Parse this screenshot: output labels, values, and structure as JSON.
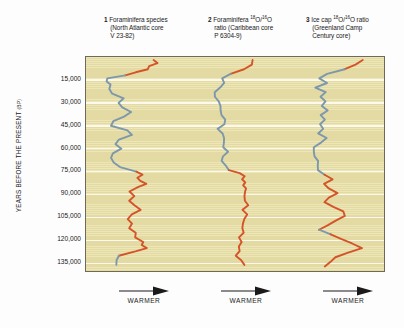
{
  "figure": {
    "background_color": "#fdfdfd",
    "plot_background_color": "#e9e1ab",
    "gridline_color": "#fdfbf0",
    "frame_color": "#6f6a58",
    "cold_color": "#7d98ab",
    "warm_color": "#d4542a",
    "y_axis_label_main": "YEARS BEFORE THE PRESENT",
    "y_axis_label_unit": "(BP)",
    "columns": [
      {
        "number": "1",
        "title": "Foraminifera species",
        "line2": "(North Atlantic core",
        "line3": "V 23-82)",
        "warmer_label": "WARMER"
      },
      {
        "number": "2",
        "title_pre": "Foraminifera ",
        "iso_sup1": "18",
        "iso_mid": "O/",
        "iso_sup2": "16",
        "iso_post": "O",
        "line2": "ratio (Caribbean core",
        "line3": "P 6304-9)",
        "warmer_label": "WARMER"
      },
      {
        "number": "3",
        "title_pre": "Ice cap ",
        "iso_sup1": "18",
        "iso_mid": "O/",
        "iso_sup2": "16",
        "iso_post": "O ratio",
        "line2": "(Greenland Camp",
        "line3": "Century core)",
        "warmer_label": "WARMER"
      }
    ]
  },
  "chart_data": {
    "type": "line",
    "title": "",
    "orientation": "vertical-depth",
    "xlabel": "WARMER",
    "ylabel": "YEARS BEFORE THE PRESENT (BP)",
    "ylim": [
      0,
      140000
    ],
    "y_inverted": true,
    "grid": true,
    "legend": "none",
    "ytick_labels": [
      "15,000",
      "30,000",
      "45,000",
      "60,000",
      "75,000",
      "90,000",
      "105,000",
      "120,000",
      "135,000"
    ],
    "ytick_values": [
      15000,
      30000,
      45000,
      60000,
      75000,
      90000,
      105000,
      120000,
      135000
    ],
    "series": [
      {
        "name": "Foraminifera species (North Atlantic core V 23-82)",
        "panel": 1,
        "x_axis_meaning": "relative warmth (right = warmer)",
        "cold_color": "#7d98ab",
        "warm_color": "#d4542a",
        "points": [
          {
            "age": 2000,
            "x": 0.74,
            "mode": "warm"
          },
          {
            "age": 4000,
            "x": 0.78,
            "mode": "warm"
          },
          {
            "age": 6000,
            "x": 0.7,
            "mode": "warm"
          },
          {
            "age": 8000,
            "x": 0.66,
            "mode": "warm"
          },
          {
            "age": 10000,
            "x": 0.56,
            "mode": "warm"
          },
          {
            "age": 12000,
            "x": 0.4,
            "mode": "cold"
          },
          {
            "age": 14000,
            "x": 0.24,
            "mode": "cold"
          },
          {
            "age": 16000,
            "x": 0.2,
            "mode": "cold"
          },
          {
            "age": 18000,
            "x": 0.26,
            "mode": "cold"
          },
          {
            "age": 21000,
            "x": 0.22,
            "mode": "cold"
          },
          {
            "age": 24000,
            "x": 0.3,
            "mode": "cold"
          },
          {
            "age": 27000,
            "x": 0.4,
            "mode": "cold"
          },
          {
            "age": 30000,
            "x": 0.33,
            "mode": "cold"
          },
          {
            "age": 33000,
            "x": 0.41,
            "mode": "cold"
          },
          {
            "age": 36000,
            "x": 0.48,
            "mode": "cold"
          },
          {
            "age": 39000,
            "x": 0.4,
            "mode": "cold"
          },
          {
            "age": 42000,
            "x": 0.3,
            "mode": "cold"
          },
          {
            "age": 45000,
            "x": 0.26,
            "mode": "cold"
          },
          {
            "age": 48000,
            "x": 0.44,
            "mode": "cold"
          },
          {
            "age": 51000,
            "x": 0.5,
            "mode": "cold"
          },
          {
            "age": 54000,
            "x": 0.36,
            "mode": "cold"
          },
          {
            "age": 57000,
            "x": 0.3,
            "mode": "cold"
          },
          {
            "age": 60000,
            "x": 0.38,
            "mode": "cold"
          },
          {
            "age": 63000,
            "x": 0.3,
            "mode": "cold"
          },
          {
            "age": 66000,
            "x": 0.24,
            "mode": "cold"
          },
          {
            "age": 69000,
            "x": 0.3,
            "mode": "cold"
          },
          {
            "age": 72000,
            "x": 0.38,
            "mode": "cold"
          },
          {
            "age": 75000,
            "x": 0.52,
            "mode": "warm"
          },
          {
            "age": 77000,
            "x": 0.64,
            "mode": "warm"
          },
          {
            "age": 79000,
            "x": 0.54,
            "mode": "warm"
          },
          {
            "age": 81000,
            "x": 0.6,
            "mode": "warm"
          },
          {
            "age": 83000,
            "x": 0.66,
            "mode": "warm"
          },
          {
            "age": 85000,
            "x": 0.56,
            "mode": "warm"
          },
          {
            "age": 88000,
            "x": 0.46,
            "mode": "warm"
          },
          {
            "age": 91000,
            "x": 0.54,
            "mode": "warm"
          },
          {
            "age": 94000,
            "x": 0.46,
            "mode": "warm"
          },
          {
            "age": 97000,
            "x": 0.52,
            "mode": "warm"
          },
          {
            "age": 100000,
            "x": 0.6,
            "mode": "warm"
          },
          {
            "age": 103000,
            "x": 0.5,
            "mode": "warm"
          },
          {
            "age": 106000,
            "x": 0.44,
            "mode": "warm"
          },
          {
            "age": 109000,
            "x": 0.5,
            "mode": "warm"
          },
          {
            "age": 112000,
            "x": 0.48,
            "mode": "warm"
          },
          {
            "age": 115000,
            "x": 0.52,
            "mode": "warm"
          },
          {
            "age": 118000,
            "x": 0.54,
            "mode": "warm"
          },
          {
            "age": 121000,
            "x": 0.64,
            "mode": "warm"
          },
          {
            "age": 123000,
            "x": 0.6,
            "mode": "warm"
          },
          {
            "age": 125000,
            "x": 0.66,
            "mode": "warm"
          },
          {
            "age": 127000,
            "x": 0.56,
            "mode": "warm"
          },
          {
            "age": 130000,
            "x": 0.36,
            "mode": "cold"
          },
          {
            "age": 133000,
            "x": 0.3,
            "mode": "cold"
          },
          {
            "age": 136000,
            "x": 0.34,
            "mode": "cold"
          }
        ]
      },
      {
        "name": "Foraminifera 18O/16O ratio (Caribbean core P 6304-9)",
        "panel": 2,
        "x_axis_meaning": "relative warmth (right = warmer)",
        "cold_color": "#7d98ab",
        "warm_color": "#d4542a",
        "points": [
          {
            "age": 2000,
            "x": 0.74,
            "mode": "warm"
          },
          {
            "age": 5000,
            "x": 0.7,
            "mode": "warm"
          },
          {
            "age": 8000,
            "x": 0.6,
            "mode": "warm"
          },
          {
            "age": 11000,
            "x": 0.46,
            "mode": "cold"
          },
          {
            "age": 14000,
            "x": 0.34,
            "mode": "cold"
          },
          {
            "age": 17000,
            "x": 0.36,
            "mode": "cold"
          },
          {
            "age": 20000,
            "x": 0.32,
            "mode": "cold"
          },
          {
            "age": 23000,
            "x": 0.26,
            "mode": "cold"
          },
          {
            "age": 26000,
            "x": 0.24,
            "mode": "cold"
          },
          {
            "age": 29000,
            "x": 0.3,
            "mode": "cold"
          },
          {
            "age": 32000,
            "x": 0.34,
            "mode": "cold"
          },
          {
            "age": 35000,
            "x": 0.3,
            "mode": "cold"
          },
          {
            "age": 38000,
            "x": 0.34,
            "mode": "cold"
          },
          {
            "age": 41000,
            "x": 0.4,
            "mode": "cold"
          },
          {
            "age": 44000,
            "x": 0.34,
            "mode": "cold"
          },
          {
            "age": 47000,
            "x": 0.3,
            "mode": "cold"
          },
          {
            "age": 50000,
            "x": 0.36,
            "mode": "cold"
          },
          {
            "age": 53000,
            "x": 0.34,
            "mode": "cold"
          },
          {
            "age": 56000,
            "x": 0.38,
            "mode": "cold"
          },
          {
            "age": 59000,
            "x": 0.36,
            "mode": "cold"
          },
          {
            "age": 62000,
            "x": 0.4,
            "mode": "cold"
          },
          {
            "age": 65000,
            "x": 0.36,
            "mode": "cold"
          },
          {
            "age": 68000,
            "x": 0.34,
            "mode": "cold"
          },
          {
            "age": 71000,
            "x": 0.38,
            "mode": "cold"
          },
          {
            "age": 74000,
            "x": 0.42,
            "mode": "warm"
          },
          {
            "age": 76000,
            "x": 0.56,
            "mode": "warm"
          },
          {
            "age": 78000,
            "x": 0.62,
            "mode": "warm"
          },
          {
            "age": 80000,
            "x": 0.58,
            "mode": "warm"
          },
          {
            "age": 82000,
            "x": 0.64,
            "mode": "warm"
          },
          {
            "age": 84000,
            "x": 0.58,
            "mode": "warm"
          },
          {
            "age": 86000,
            "x": 0.66,
            "mode": "warm"
          },
          {
            "age": 88000,
            "x": 0.6,
            "mode": "warm"
          },
          {
            "age": 91000,
            "x": 0.64,
            "mode": "warm"
          },
          {
            "age": 94000,
            "x": 0.62,
            "mode": "warm"
          },
          {
            "age": 97000,
            "x": 0.64,
            "mode": "warm"
          },
          {
            "age": 100000,
            "x": 0.62,
            "mode": "warm"
          },
          {
            "age": 103000,
            "x": 0.64,
            "mode": "warm"
          },
          {
            "age": 106000,
            "x": 0.6,
            "mode": "warm"
          },
          {
            "age": 109000,
            "x": 0.62,
            "mode": "warm"
          },
          {
            "age": 112000,
            "x": 0.58,
            "mode": "warm"
          },
          {
            "age": 115000,
            "x": 0.6,
            "mode": "warm"
          },
          {
            "age": 118000,
            "x": 0.56,
            "mode": "warm"
          },
          {
            "age": 121000,
            "x": 0.58,
            "mode": "warm"
          },
          {
            "age": 124000,
            "x": 0.54,
            "mode": "warm"
          },
          {
            "age": 127000,
            "x": 0.56,
            "mode": "warm"
          },
          {
            "age": 130000,
            "x": 0.52,
            "mode": "warm"
          },
          {
            "age": 133000,
            "x": 0.56,
            "mode": "warm"
          },
          {
            "age": 136000,
            "x": 0.62,
            "mode": "warm"
          }
        ]
      },
      {
        "name": "Ice cap 18O/16O ratio (Greenland Camp Century core)",
        "panel": 3,
        "x_axis_meaning": "relative warmth (right = warmer)",
        "cold_color": "#7d98ab",
        "warm_color": "#d4542a",
        "points": [
          {
            "age": 2000,
            "x": 0.8,
            "mode": "warm"
          },
          {
            "age": 5000,
            "x": 0.72,
            "mode": "warm"
          },
          {
            "age": 8000,
            "x": 0.58,
            "mode": "cold"
          },
          {
            "age": 11000,
            "x": 0.44,
            "mode": "cold"
          },
          {
            "age": 14000,
            "x": 0.34,
            "mode": "cold"
          },
          {
            "age": 17000,
            "x": 0.4,
            "mode": "cold"
          },
          {
            "age": 20000,
            "x": 0.32,
            "mode": "cold"
          },
          {
            "age": 23000,
            "x": 0.4,
            "mode": "cold"
          },
          {
            "age": 26000,
            "x": 0.34,
            "mode": "cold"
          },
          {
            "age": 29000,
            "x": 0.42,
            "mode": "cold"
          },
          {
            "age": 32000,
            "x": 0.36,
            "mode": "cold"
          },
          {
            "age": 35000,
            "x": 0.42,
            "mode": "cold"
          },
          {
            "age": 38000,
            "x": 0.36,
            "mode": "cold"
          },
          {
            "age": 41000,
            "x": 0.4,
            "mode": "cold"
          },
          {
            "age": 44000,
            "x": 0.34,
            "mode": "cold"
          },
          {
            "age": 47000,
            "x": 0.38,
            "mode": "cold"
          },
          {
            "age": 50000,
            "x": 0.34,
            "mode": "cold"
          },
          {
            "age": 53000,
            "x": 0.4,
            "mode": "cold"
          },
          {
            "age": 56000,
            "x": 0.36,
            "mode": "cold"
          },
          {
            "age": 59000,
            "x": 0.3,
            "mode": "cold"
          },
          {
            "age": 62000,
            "x": 0.26,
            "mode": "cold"
          },
          {
            "age": 65000,
            "x": 0.3,
            "mode": "cold"
          },
          {
            "age": 68000,
            "x": 0.34,
            "mode": "cold"
          },
          {
            "age": 71000,
            "x": 0.3,
            "mode": "cold"
          },
          {
            "age": 74000,
            "x": 0.34,
            "mode": "cold"
          },
          {
            "age": 77000,
            "x": 0.4,
            "mode": "warm"
          },
          {
            "age": 80000,
            "x": 0.46,
            "mode": "warm"
          },
          {
            "age": 83000,
            "x": 0.4,
            "mode": "warm"
          },
          {
            "age": 86000,
            "x": 0.44,
            "mode": "warm"
          },
          {
            "age": 89000,
            "x": 0.52,
            "mode": "warm"
          },
          {
            "age": 92000,
            "x": 0.44,
            "mode": "warm"
          },
          {
            "age": 95000,
            "x": 0.4,
            "mode": "warm"
          },
          {
            "age": 98000,
            "x": 0.48,
            "mode": "warm"
          },
          {
            "age": 101000,
            "x": 0.58,
            "mode": "warm"
          },
          {
            "age": 104000,
            "x": 0.62,
            "mode": "warm"
          },
          {
            "age": 107000,
            "x": 0.5,
            "mode": "warm"
          },
          {
            "age": 110000,
            "x": 0.42,
            "mode": "warm"
          },
          {
            "age": 113000,
            "x": 0.36,
            "mode": "cold"
          },
          {
            "age": 116000,
            "x": 0.44,
            "mode": "warm"
          },
          {
            "age": 119000,
            "x": 0.56,
            "mode": "warm"
          },
          {
            "age": 122000,
            "x": 0.7,
            "mode": "warm"
          },
          {
            "age": 125000,
            "x": 0.76,
            "mode": "warm"
          },
          {
            "age": 128000,
            "x": 0.64,
            "mode": "warm"
          },
          {
            "age": 131000,
            "x": 0.52,
            "mode": "warm"
          },
          {
            "age": 134000,
            "x": 0.44,
            "mode": "warm"
          },
          {
            "age": 137000,
            "x": 0.4,
            "mode": "warm"
          }
        ]
      }
    ]
  }
}
